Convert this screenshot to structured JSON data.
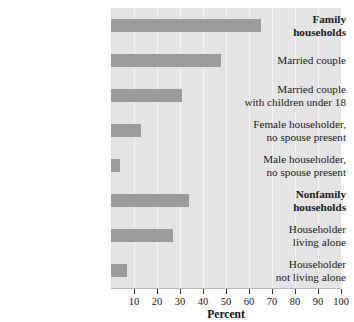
{
  "chart_data": {
    "type": "bar",
    "orientation": "horizontal",
    "title": "",
    "xlabel": "Percent",
    "ylabel": "",
    "xlim": [
      0,
      100
    ],
    "xticks": [
      10,
      20,
      30,
      40,
      50,
      60,
      70,
      80,
      90,
      100
    ],
    "grid": true,
    "legend": null,
    "categories": [
      "Family\nhouseholds",
      "Married couple",
      "Married couple\nwith children under 18",
      "Female householder,\nno spouse present",
      "Male householder,\nno spouse present",
      "Nonfamily\nhouseholds",
      "Householder\nliving alone",
      "Householder\nnot living alone"
    ],
    "values": [
      65,
      48,
      31,
      13,
      4,
      34,
      27,
      7
    ],
    "emphasis": [
      true,
      false,
      false,
      false,
      false,
      true,
      false,
      false
    ],
    "bar_color": "#9b9b9b",
    "panel_color": "#e4e4e4",
    "gridline_color": "#f4f4f4"
  },
  "axis": {
    "title": "Percent",
    "tick_labels": [
      "10",
      "20",
      "30",
      "40",
      "50",
      "60",
      "70",
      "80",
      "90",
      "100"
    ]
  }
}
